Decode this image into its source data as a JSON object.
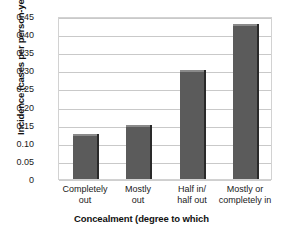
{
  "chart_data": {
    "type": "bar",
    "title": "",
    "subtitle": "",
    "xlabel": "Concealment (degree to which",
    "ylabel": "Incidence (cases per person-year)",
    "categories": [
      "Completely out",
      "Mostly out",
      "Half in/ half out",
      "Mostly or completely in"
    ],
    "category_lines": [
      [
        "Completely",
        "out"
      ],
      [
        "Mostly",
        "out"
      ],
      [
        "Half in/",
        "half out"
      ],
      [
        "Mostly or",
        "completely in"
      ]
    ],
    "values": [
      0.125,
      0.148,
      0.3,
      0.428
    ],
    "ylim": [
      0,
      0.45
    ],
    "ytick_values": [
      0,
      0.05,
      0.1,
      0.15,
      0.2,
      0.25,
      0.3,
      0.35,
      0.4,
      0.45
    ],
    "ytick_labels": [
      "0",
      "0.05",
      "0.10",
      "0.15",
      "0.20",
      "0.25",
      "0.30",
      "0.35",
      "0.40",
      "0.45"
    ],
    "grid": true,
    "legend": false,
    "legend_position": "none",
    "bar_color": "#5b5b5b",
    "bar_edge_color": "#2a2a2a",
    "grid_color": "#c9c9c9",
    "background_color": "#ffffff",
    "text_color": "#1a1a1a"
  }
}
